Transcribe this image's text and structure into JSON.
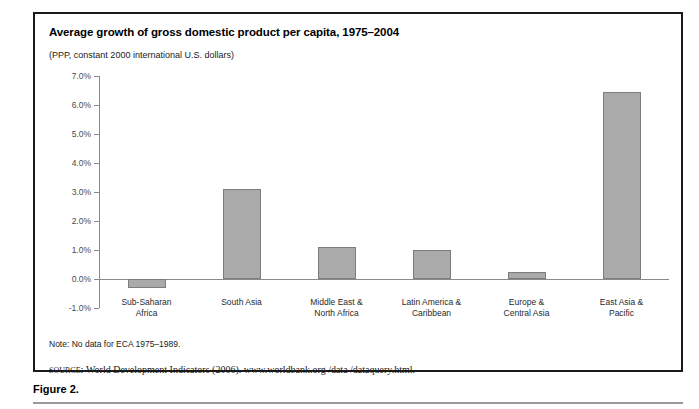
{
  "figure": {
    "caption": "Figure 2."
  },
  "chart_data": {
    "type": "bar",
    "title": "Average growth of gross domestic product per capita, 1975–2004",
    "subtitle": "(PPP,  constant 2000 international U.S. dollars)",
    "xlabel": "",
    "ylabel": "",
    "categories": [
      "Sub-Saharan\nAfrica",
      "South Asia",
      "Middle East &\nNorth Africa",
      "Latin America &\nCaribbean",
      "Europe &\nCentral Asia",
      "East Asia &\nPacific"
    ],
    "values": [
      -0.3,
      3.1,
      1.1,
      1.0,
      0.25,
      6.45
    ],
    "value_labels": [
      "-0.3%",
      "3.1%",
      "1.1%",
      "1.0%",
      "0.25%",
      "6.45%"
    ],
    "ylim": [
      -1.0,
      7.0
    ],
    "ytick_labels": [
      "7.0%",
      "6.0%",
      "5.0%",
      "4.0%",
      "3.0%",
      "2.0%",
      "1.0%",
      "0.0%",
      "-1.0%"
    ],
    "ytick_values": [
      7.0,
      6.0,
      5.0,
      4.0,
      3.0,
      2.0,
      1.0,
      0.0,
      -1.0
    ],
    "grid": false,
    "legend": null,
    "bar_color": "#aaaaaa",
    "bar_border_color": "#7d7d7d",
    "axis_color": "#8a8a8a"
  },
  "notes": {
    "note": "Note: No data for ECA 1975–1989.",
    "source_label": "source:",
    "source_text": "World Development Indicators (2006). www.worldbank.org /data /dataquery.html."
  }
}
